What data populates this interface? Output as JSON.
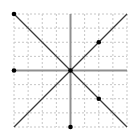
{
  "chart_data": {
    "type": "scatter",
    "title": "",
    "xlabel": "",
    "ylabel": "",
    "xlim": [
      -4,
      4
    ],
    "ylim": [
      -4,
      4
    ],
    "grid": "on",
    "grid_step": 1,
    "grid_style": "dashed",
    "axes": {
      "x_axis": {
        "y": 0,
        "from": -4,
        "to": 4
      },
      "y_axis": {
        "x": 0,
        "from": -4,
        "to": 4
      }
    },
    "lines": [
      {
        "name": "y-equals-x",
        "from": [
          -4,
          -4
        ],
        "to": [
          4,
          4
        ]
      },
      {
        "name": "y-equals-neg-x",
        "from": [
          -4,
          4
        ],
        "to": [
          4,
          -4
        ]
      }
    ],
    "points": [
      {
        "x": -4,
        "y": 4
      },
      {
        "x": -4,
        "y": 0
      },
      {
        "x": 0,
        "y": 0
      },
      {
        "x": 2,
        "y": 2
      },
      {
        "x": 2,
        "y": -2
      },
      {
        "x": 0,
        "y": -4
      }
    ],
    "tick_labels": [],
    "legend": "none"
  },
  "colors": {
    "background": "#ffffff",
    "grid": "#c6c6c6",
    "axis": "#8f8f8f",
    "line": "#3a3a3a",
    "point": "#000000"
  },
  "layout": {
    "canvas_w": 136,
    "canvas_h": 136,
    "plot_left": 14,
    "plot_top": 14,
    "plot_right": 127,
    "plot_bottom": 127
  }
}
